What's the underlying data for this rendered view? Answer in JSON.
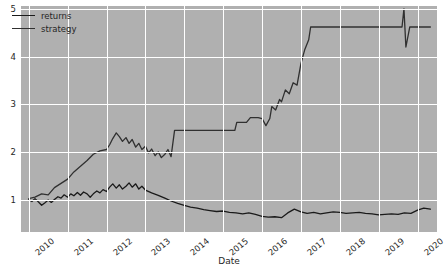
{
  "chart_data": {
    "type": "line",
    "title": "",
    "xlabel": "Date",
    "ylabel": "",
    "xlim": [
      2009.8,
      2020.5
    ],
    "ylim": [
      0.32,
      5.06
    ],
    "grid": true,
    "legend_position": "upper left",
    "xticks": [
      "2010",
      "2011",
      "2012",
      "2013",
      "2014",
      "2015",
      "2016",
      "2017",
      "2018",
      "2019",
      "2020"
    ],
    "xtick_values": [
      2010,
      2011,
      2012,
      2013,
      2014,
      2015,
      2016,
      2017,
      2018,
      2019,
      2020
    ],
    "yticks": [
      "1",
      "2",
      "3",
      "4",
      "5"
    ],
    "ytick_values": [
      1,
      2,
      3,
      4,
      5
    ],
    "background_color": "#b0b0b0",
    "grid_color": "#ffffff",
    "series": [
      {
        "name": "returns",
        "color": "#1a1a1a",
        "x": [
          2010.0,
          2010.08,
          2010.16,
          2010.25,
          2010.33,
          2010.41,
          2010.5,
          2010.58,
          2010.66,
          2010.75,
          2010.83,
          2010.91,
          2011.0,
          2011.08,
          2011.16,
          2011.25,
          2011.33,
          2011.41,
          2011.5,
          2011.58,
          2011.66,
          2011.75,
          2011.83,
          2011.91,
          2012.0,
          2012.08,
          2012.16,
          2012.25,
          2012.33,
          2012.41,
          2012.5,
          2012.58,
          2012.66,
          2012.75,
          2012.83,
          2012.91,
          2013.0,
          2013.16,
          2013.33,
          2013.5,
          2013.66,
          2013.83,
          2014.0,
          2014.16,
          2014.33,
          2014.5,
          2014.66,
          2014.83,
          2015.0,
          2015.16,
          2015.33,
          2015.5,
          2015.66,
          2015.83,
          2016.0,
          2016.16,
          2016.33,
          2016.5,
          2016.66,
          2016.83,
          2017.0,
          2017.16,
          2017.33,
          2017.5,
          2017.66,
          2017.83,
          2018.0,
          2018.16,
          2018.33,
          2018.5,
          2018.66,
          2018.83,
          2019.0,
          2019.16,
          2019.33,
          2019.5,
          2019.66,
          2019.83,
          2020.0,
          2020.16,
          2020.33
        ],
        "y": [
          1.0,
          0.96,
          1.02,
          0.95,
          0.88,
          0.93,
          0.99,
          0.94,
          1.0,
          1.06,
          1.03,
          1.1,
          1.05,
          1.12,
          1.08,
          1.15,
          1.09,
          1.16,
          1.12,
          1.05,
          1.12,
          1.18,
          1.14,
          1.21,
          1.17,
          1.26,
          1.33,
          1.24,
          1.31,
          1.22,
          1.28,
          1.35,
          1.26,
          1.33,
          1.22,
          1.28,
          1.2,
          1.14,
          1.09,
          1.03,
          0.97,
          0.92,
          0.88,
          0.84,
          0.82,
          0.79,
          0.77,
          0.75,
          0.76,
          0.73,
          0.72,
          0.7,
          0.72,
          0.69,
          0.65,
          0.63,
          0.64,
          0.62,
          0.72,
          0.8,
          0.74,
          0.71,
          0.73,
          0.7,
          0.72,
          0.74,
          0.73,
          0.71,
          0.72,
          0.73,
          0.71,
          0.7,
          0.68,
          0.69,
          0.7,
          0.69,
          0.72,
          0.71,
          0.78,
          0.82,
          0.8
        ]
      },
      {
        "name": "strategy",
        "color": "#303030",
        "x": [
          2010.0,
          2010.16,
          2010.33,
          2010.5,
          2010.66,
          2010.83,
          2011.0,
          2011.16,
          2011.33,
          2011.5,
          2011.66,
          2011.83,
          2012.0,
          2012.08,
          2012.16,
          2012.25,
          2012.33,
          2012.41,
          2012.5,
          2012.58,
          2012.66,
          2012.75,
          2012.83,
          2012.91,
          2013.0,
          2013.08,
          2013.16,
          2013.25,
          2013.33,
          2013.41,
          2013.5,
          2013.58,
          2013.66,
          2013.75,
          2014.0,
          2014.5,
          2015.0,
          2015.3,
          2015.35,
          2015.6,
          2015.7,
          2015.9,
          2016.0,
          2016.1,
          2016.2,
          2016.25,
          2016.35,
          2016.45,
          2016.5,
          2016.6,
          2016.7,
          2016.8,
          2016.9,
          2017.0,
          2017.1,
          2017.2,
          2017.25,
          2018.0,
          2019.0,
          2019.6,
          2019.65,
          2019.7,
          2019.8,
          2020.0,
          2020.33
        ],
        "y": [
          1.02,
          1.05,
          1.12,
          1.1,
          1.25,
          1.34,
          1.43,
          1.58,
          1.7,
          1.82,
          1.95,
          2.02,
          2.05,
          2.15,
          2.28,
          2.4,
          2.32,
          2.22,
          2.3,
          2.18,
          2.26,
          2.1,
          2.18,
          2.05,
          2.12,
          1.98,
          2.06,
          1.92,
          2.0,
          1.88,
          1.95,
          2.05,
          1.9,
          2.45,
          2.45,
          2.45,
          2.45,
          2.45,
          2.62,
          2.62,
          2.72,
          2.72,
          2.7,
          2.55,
          2.7,
          2.95,
          2.88,
          3.1,
          3.05,
          3.3,
          3.22,
          3.45,
          3.4,
          3.85,
          4.15,
          4.35,
          4.62,
          4.62,
          4.62,
          4.62,
          5.0,
          4.2,
          4.62,
          4.62,
          4.62
        ]
      }
    ]
  },
  "legend": {
    "items": [
      {
        "label": "returns"
      },
      {
        "label": "strategy"
      }
    ]
  },
  "axis": {
    "x_title": "Date"
  }
}
